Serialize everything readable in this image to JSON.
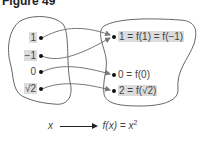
{
  "figure": {
    "title": "Figure 49"
  },
  "domain_set": {
    "items": [
      {
        "label": "1",
        "highlight": true
      },
      {
        "label": "−1",
        "highlight": true
      },
      {
        "label": "0",
        "highlight": false
      },
      {
        "label": "√2",
        "highlight": true
      }
    ]
  },
  "range_set": {
    "items": [
      {
        "label": "1 = f(1) = f(−1)",
        "highlight": true
      },
      {
        "label": "0 = f(0)",
        "highlight": false
      },
      {
        "label": "2 = f(√2)",
        "highlight": true
      }
    ]
  },
  "mappings": [
    {
      "from": "1",
      "to": "1 = f(1) = f(−1)"
    },
    {
      "from": "−1",
      "to": "1 = f(1) = f(−1)"
    },
    {
      "from": "0",
      "to": "0 = f(0)"
    },
    {
      "from": "√2",
      "to": "2 = f(√2)"
    }
  ],
  "caption": {
    "left": "x",
    "right": "f(x) = x",
    "exponent": "2"
  },
  "colors": {
    "highlight": "#dcdcdc",
    "stroke": "#555555",
    "arrow": "#777777",
    "dot": "#111111"
  }
}
